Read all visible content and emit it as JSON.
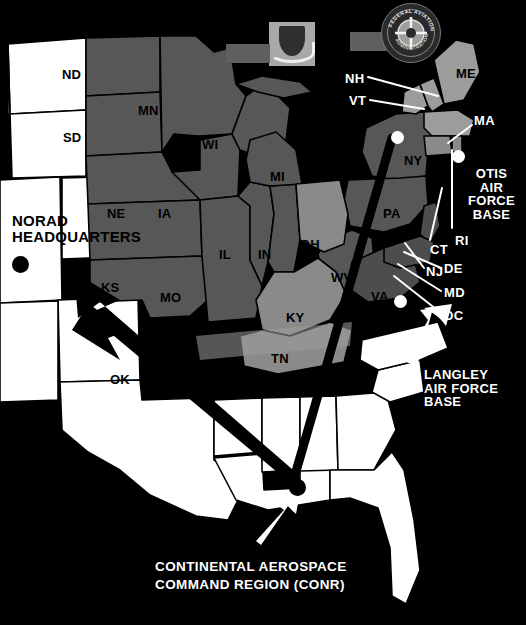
{
  "figure": {
    "kind": "map",
    "background_color": "#000000"
  },
  "emblems": [
    {
      "name": "usaf-shield-emblem",
      "alt": "United States Air Force shield and wings emblem",
      "plate_color": "#a8a8a8"
    },
    {
      "name": "faa-seal-emblem",
      "alt": "Federal Aviation Administration circular seal",
      "ring_text_top": "FEDERAL AVIATION",
      "ring_text_bottom": "ADMINISTRATION"
    }
  ],
  "legend_colors": {
    "outside_region": "#ffffff",
    "region_medium": "#575757",
    "region_light": "#8a8a8a",
    "region_lighter": "#9c9c9c",
    "ocean_background": "#000000",
    "border_line": "#000000",
    "callout_text": "#ffffff"
  },
  "state_labels": [
    {
      "code": "ND",
      "x": 62,
      "y": 68,
      "tone": "dark"
    },
    {
      "code": "SD",
      "x": 63,
      "y": 131,
      "tone": "dark"
    },
    {
      "code": "MN",
      "x": 138,
      "y": 104,
      "tone": "dark"
    },
    {
      "code": "WI",
      "x": 202,
      "y": 138,
      "tone": "dark"
    },
    {
      "code": "MI",
      "x": 270,
      "y": 170,
      "tone": "dark"
    },
    {
      "code": "NE",
      "x": 107,
      "y": 207,
      "tone": "dark"
    },
    {
      "code": "IA",
      "x": 158,
      "y": 207,
      "tone": "dark"
    },
    {
      "code": "IL",
      "x": 219,
      "y": 248,
      "tone": "dark"
    },
    {
      "code": "IN",
      "x": 258,
      "y": 248,
      "tone": "dark"
    },
    {
      "code": "OH",
      "x": 300,
      "y": 238,
      "tone": "dark"
    },
    {
      "code": "KS",
      "x": 101,
      "y": 281,
      "tone": "dark"
    },
    {
      "code": "MO",
      "x": 160,
      "y": 291,
      "tone": "dark"
    },
    {
      "code": "KY",
      "x": 286,
      "y": 311,
      "tone": "dark"
    },
    {
      "code": "WV",
      "x": 331,
      "y": 271,
      "tone": "dark"
    },
    {
      "code": "VA",
      "x": 371,
      "y": 290,
      "tone": "dark"
    },
    {
      "code": "PA",
      "x": 383,
      "y": 207,
      "tone": "dark"
    },
    {
      "code": "TN",
      "x": 271,
      "y": 352,
      "tone": "dark"
    },
    {
      "code": "OK",
      "x": 110,
      "y": 373,
      "tone": "dark"
    },
    {
      "code": "NY",
      "x": 404,
      "y": 154,
      "tone": "dark"
    },
    {
      "code": "ME",
      "x": 456,
      "y": 67,
      "tone": "dark"
    }
  ],
  "callout_labels": [
    {
      "text": "NH",
      "x": 345,
      "y": 72,
      "color": "#ffffff"
    },
    {
      "text": "VT",
      "x": 349,
      "y": 94,
      "color": "#ffffff"
    },
    {
      "text": "MA",
      "x": 474,
      "y": 114,
      "color": "#ffffff"
    },
    {
      "text": "CT",
      "x": 430,
      "y": 243,
      "color": "#ffffff"
    },
    {
      "text": "RI",
      "x": 455,
      "y": 234,
      "color": "#ffffff"
    },
    {
      "text": "NJ",
      "x": 426,
      "y": 265,
      "color": "#ffffff"
    },
    {
      "text": "DE",
      "x": 444,
      "y": 262,
      "color": "#ffffff"
    },
    {
      "text": "MD",
      "x": 444,
      "y": 286,
      "color": "#ffffff"
    },
    {
      "text": "DC",
      "x": 444,
      "y": 309,
      "color": "#ffffff"
    }
  ],
  "annotations": {
    "norad": {
      "label": "NORAD\nHEADQUARTERS",
      "x": 12,
      "y": 213,
      "color": "#000000",
      "marker": "black-dot",
      "marker_x": 12,
      "marker_y": 256
    },
    "otis": {
      "label": "OTIS\nAIR\nFORCE\nBASE",
      "x": 468,
      "y": 167,
      "color": "#ffffff",
      "marker": "white-dot",
      "marker_x": 452,
      "marker_y": 150
    },
    "langley": {
      "label": "LANGLEY\nAIR FORCE\nBASE",
      "x": 424,
      "y": 368,
      "color": "#ffffff",
      "marker": "white-dot",
      "marker_x": 394,
      "marker_y": 295
    },
    "conr": {
      "label": "CONTINENTAL AEROSPACE\nCOMMAND REGION (CONR)",
      "x": 155,
      "y": 558,
      "color": "#ffffff",
      "marker": "black-dot",
      "marker_x": 289,
      "marker_y": 479
    },
    "neads": {
      "marker": "white-dot",
      "marker_x": 391,
      "marker_y": 131
    }
  }
}
